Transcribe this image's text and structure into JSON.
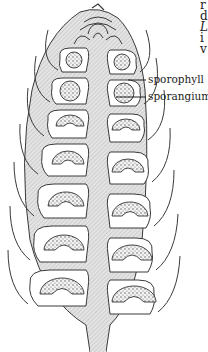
{
  "figure": {
    "labels": {
      "sporophyll": "sporophyll",
      "sporangium": "sporangium"
    },
    "edge_text_fragments": [
      "r",
      "d",
      "L",
      "i",
      "v"
    ],
    "colors": {
      "tissue_fill": "#dcdcdc",
      "outline": "#3a3a3a",
      "cavity": "#ffffff",
      "spore_fill": "#cfcfcf",
      "text": "#222222"
    }
  }
}
